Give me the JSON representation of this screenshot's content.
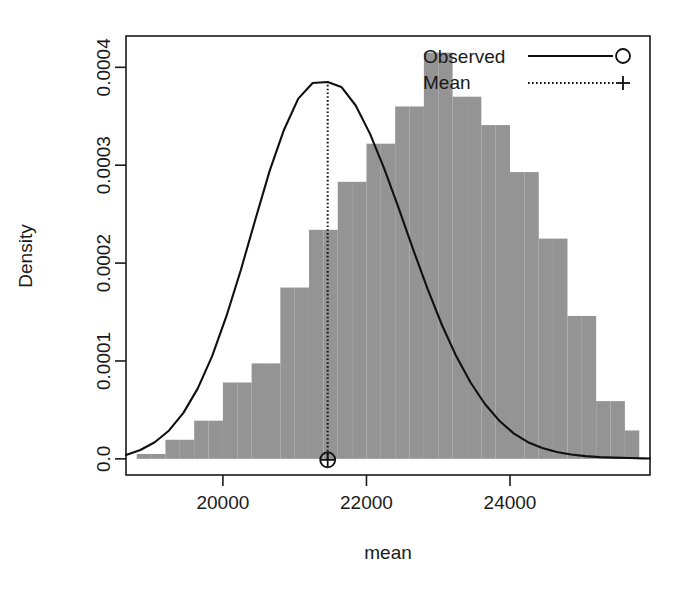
{
  "figure": {
    "type": "histogram-with-density",
    "background": "#ffffff",
    "bar_color": "#949494",
    "line_color": "#101010"
  },
  "axes": {
    "x_label": "mean",
    "y_label": "Density",
    "x_ticks": [
      "20000",
      "22000",
      "24000"
    ],
    "x_tick_values": [
      20000,
      22000,
      24000
    ],
    "y_ticks": [
      "0.0",
      "0.0001",
      "0.0002",
      "0.0003",
      "0.0004"
    ],
    "y_tick_values": [
      0.0,
      0.0001,
      0.0002,
      0.0003,
      0.0004
    ],
    "xlim": [
      18650,
      25950
    ],
    "ylim": [
      -1.65e-05,
      0.000432
    ],
    "grid": false,
    "frame": true
  },
  "legend": {
    "position": "top-right",
    "items": [
      {
        "label": "Observed",
        "line_style": "solid",
        "marker": "circle"
      },
      {
        "label": "Mean",
        "line_style": "dotted",
        "marker": "plus"
      }
    ]
  },
  "chart_data": {
    "type": "bar",
    "title": "",
    "subtitle": "",
    "xlabel": "mean",
    "ylabel": "Density",
    "xlim": [
      18650,
      25950
    ],
    "ylim": [
      0,
      0.000432
    ],
    "grid": false,
    "legend_position": "top-right",
    "bin_width": 200,
    "categories": [
      "18800-19000",
      "19000-19200",
      "19200-19400",
      "19400-19600",
      "19600-19800",
      "19800-20000",
      "20000-20200",
      "20200-20400",
      "20400-20600",
      "20600-20800",
      "20800-21000",
      "21000-21200",
      "21200-21400",
      "21400-21600",
      "21600-21800",
      "21800-22000",
      "22000-22200",
      "22200-22400",
      "22400-22600",
      "22600-22800",
      "22800-23000",
      "23000-23200",
      "23200-23400",
      "23400-23600",
      "23600-23800",
      "23800-24000",
      "24000-24200",
      "24200-24400",
      "24400-24600",
      "24600-24800",
      "24800-25000",
      "25000-25200",
      "25200-25400",
      "25400-25600",
      "25600-25800"
    ],
    "bin_centers": [
      18900,
      19100,
      19300,
      19500,
      19700,
      19900,
      20100,
      20300,
      20500,
      20700,
      20900,
      21100,
      21300,
      21500,
      21700,
      21900,
      22100,
      22300,
      22500,
      22700,
      22900,
      23100,
      23300,
      23500,
      23700,
      23900,
      24100,
      24300,
      24500,
      24700,
      24900,
      25100,
      25300,
      25500,
      25700
    ],
    "values": [
      5e-06,
      5e-06,
      1.95e-05,
      1.95e-05,
      3.9e-05,
      3.9e-05,
      7.8e-05,
      7.8e-05,
      9.75e-05,
      9.75e-05,
      0.000175,
      0.000175,
      0.000234,
      0.000234,
      0.000283,
      0.000283,
      0.000322,
      0.000322,
      0.00036,
      0.00036,
      0.000415,
      0.000415,
      0.00037,
      0.00037,
      0.000341,
      0.000341,
      0.000293,
      0.000293,
      0.000225,
      0.000225,
      0.000146,
      0.000146,
      5.9e-05,
      5.9e-05,
      2.9e-05
    ],
    "series": [
      {
        "name": "Observed",
        "type": "line",
        "x": [
          18650,
          18850,
          19050,
          19250,
          19450,
          19650,
          19850,
          20050,
          20250,
          20450,
          20650,
          20850,
          21050,
          21250,
          21460,
          21650,
          21850,
          22050,
          22250,
          22450,
          22650,
          22850,
          23050,
          23250,
          23450,
          23650,
          23850,
          24050,
          24250,
          24450,
          24650,
          24850,
          25050,
          25250,
          25450,
          25650,
          25850,
          25950
        ],
        "y": [
          4e-06,
          9e-06,
          1.7e-05,
          2.9e-05,
          4.7e-05,
          7.2e-05,
          0.000105,
          0.000146,
          0.000193,
          0.000244,
          0.000294,
          0.000336,
          0.000368,
          0.000384,
          0.000385,
          0.00038,
          0.000361,
          0.000332,
          0.000296,
          0.000256,
          0.000214,
          0.000174,
          0.000137,
          0.000105,
          7.8e-05,
          5.6e-05,
          3.9e-05,
          2.6e-05,
          1.7e-05,
          1.1e-05,
          7e-06,
          4.5e-06,
          2.8e-06,
          1.8e-06,
          1.2e-06,
          8e-07,
          5e-07,
          4e-07
        ]
      },
      {
        "name": "Mean",
        "type": "vline",
        "x": 21460,
        "y_top": 0.000385,
        "y_bottom": 0.0,
        "marker": "plus-in-circle"
      }
    ],
    "annotations": [
      {
        "kind": "mean-marker",
        "x": 21460,
        "y": 0.0,
        "glyph": "circle-plus"
      }
    ]
  }
}
